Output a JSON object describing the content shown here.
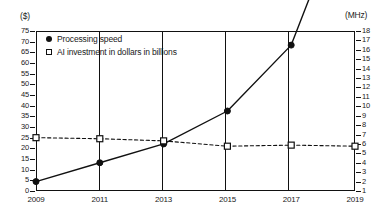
{
  "chart_data": {
    "type": "line",
    "title": "",
    "subtitle": "",
    "xlabel": "",
    "ylabel": "($)",
    "y2label": "(MHz)",
    "grid": "vertical-only",
    "legend_position": "top-left",
    "categories": [
      "2009",
      "2011",
      "2013",
      "2015",
      "2017",
      "2019"
    ],
    "x": [
      2009,
      2011,
      2013,
      2015,
      2017,
      2019
    ],
    "ylim": [
      0,
      75
    ],
    "yticks": [
      0,
      5,
      10,
      15,
      20,
      25,
      30,
      35,
      40,
      45,
      50,
      55,
      60,
      65,
      70,
      75
    ],
    "y2lim": [
      1,
      18
    ],
    "y2ticks": [
      1,
      2,
      3,
      4,
      5,
      6,
      7,
      8,
      9,
      10,
      11,
      12,
      13,
      14,
      15,
      16,
      17,
      18
    ],
    "series": [
      {
        "name": "Processing speed",
        "axis": "right",
        "unit": "MHz",
        "marker": "filled-circle",
        "line_style": "solid",
        "values_mhz": [
          2,
          4,
          6,
          9.5,
          16.5,
          34
        ],
        "values": [
          2,
          4.5,
          8.5,
          19,
          34,
          66.5
        ]
      },
      {
        "name": "AI investment in dollars in billions",
        "axis": "left",
        "unit": "$",
        "marker": "open-square",
        "line_style": "dashed",
        "values": [
          25,
          24.5,
          23.5,
          21,
          21.5,
          21
        ]
      }
    ]
  },
  "axes": {
    "left_unit": "($)",
    "right_unit": "(MHz)",
    "left_ticks": [
      "75",
      "70",
      "65",
      "60",
      "55",
      "50",
      "45",
      "40",
      "35",
      "30",
      "25",
      "20",
      "15",
      "10",
      "5",
      "0"
    ],
    "right_ticks": [
      "18",
      "17",
      "16",
      "15",
      "14",
      "13",
      "12",
      "11",
      "10",
      "9",
      "8",
      "7",
      "6",
      "5",
      "4",
      "3",
      "2",
      "1"
    ],
    "x_ticks": [
      "2009",
      "2011",
      "2013",
      "2015",
      "2017",
      "2019"
    ]
  },
  "legend": {
    "items": [
      {
        "label": "Processing speed",
        "marker": "filled-circle"
      },
      {
        "label": "AI investment in dollars in billions",
        "marker": "open-square"
      }
    ]
  },
  "colors": {
    "ink": "#111111",
    "background": "#ffffff",
    "series_speed": "#111111",
    "series_investment": "#111111"
  }
}
